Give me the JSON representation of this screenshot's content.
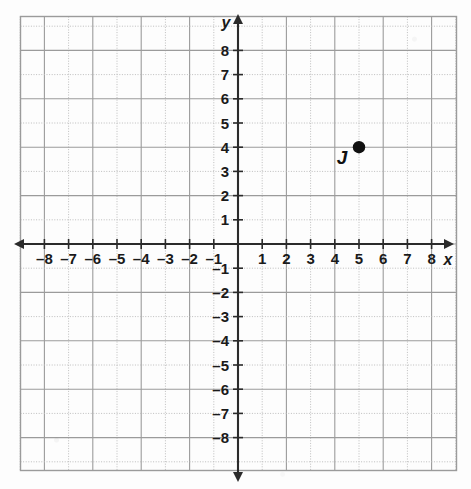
{
  "figure": {
    "kind": "coordinate-plane",
    "background_color": "#fdfdfd",
    "grid_color": "#9b9b9b",
    "grid_dotted_color": "#bdbdbd",
    "axis_color": "#2b2b2b",
    "point_color": "#111111"
  },
  "axes": {
    "x_name": "x",
    "y_name": "y",
    "x_min": -9,
    "x_max": 9,
    "y_min": -9,
    "y_max": 9,
    "x_tick_labels": [
      "–8",
      "–7",
      "–6",
      "–5",
      "–4",
      "–3",
      "–2",
      "–1",
      "1",
      "2",
      "3",
      "4",
      "5",
      "6",
      "7",
      "8"
    ],
    "x_tick_values": [
      -8,
      -7,
      -6,
      -5,
      -4,
      -3,
      -2,
      -1,
      1,
      2,
      3,
      4,
      5,
      6,
      7,
      8
    ],
    "y_tick_labels": [
      "8",
      "7",
      "6",
      "5",
      "4",
      "3",
      "2",
      "1",
      "–1",
      "–2",
      "–3",
      "–4",
      "–5",
      "–6",
      "–7",
      "–8"
    ],
    "y_tick_values": [
      8,
      7,
      6,
      5,
      4,
      3,
      2,
      1,
      -1,
      -2,
      -3,
      -4,
      -5,
      -6,
      -7,
      -8
    ],
    "arrow_ends": [
      "left",
      "right",
      "up",
      "down"
    ]
  },
  "chart_data": {
    "type": "scatter",
    "title": "",
    "xlabel": "x",
    "ylabel": "y",
    "xlim": [
      -9,
      9
    ],
    "ylim": [
      -9,
      9
    ],
    "grid": true,
    "legend": "none",
    "points": [
      {
        "label": "J",
        "x": 5,
        "y": 4
      }
    ],
    "xticks": [
      -8,
      -7,
      -6,
      -5,
      -4,
      -3,
      -2,
      -1,
      1,
      2,
      3,
      4,
      5,
      6,
      7,
      8
    ],
    "yticks": [
      8,
      7,
      6,
      5,
      4,
      3,
      2,
      1,
      -1,
      -2,
      -3,
      -4,
      -5,
      -6,
      -7,
      -8
    ]
  }
}
